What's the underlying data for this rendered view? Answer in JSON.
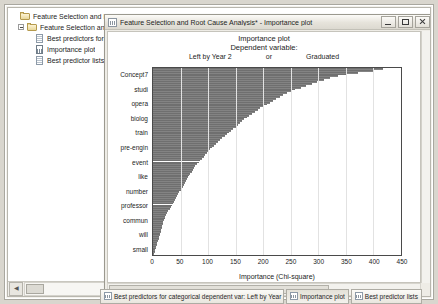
{
  "window": {
    "title": "Feature Selection and Root Cause Analysis* - Importance plot",
    "icon": "chart-document-icon",
    "buttons": {
      "minimize": "Minimize",
      "maximize": "Maximize",
      "close": "Close"
    }
  },
  "tree": {
    "nodes": [
      {
        "label": "Feature Selection and Root",
        "icon": "folder-icon",
        "depth": 0,
        "expander": false
      },
      {
        "label": "Feature Selection and R",
        "icon": "folder-icon",
        "depth": 1,
        "expander": true
      },
      {
        "label": "Best predictors for c",
        "icon": "spreadsheet-icon",
        "depth": 2,
        "expander": false
      },
      {
        "label": "Importance plot",
        "icon": "chart-icon",
        "depth": 2,
        "expander": false
      },
      {
        "label": "Best predictor lists",
        "icon": "spreadsheet-icon",
        "depth": 2,
        "expander": false
      }
    ]
  },
  "taskbar": {
    "items": [
      {
        "label": "Best predictors for categorical dependent var: Left by Year 2..",
        "icon": "spreadsheet-icon"
      },
      {
        "label": "Importance plot",
        "icon": "chart-icon"
      },
      {
        "label": "Best predictor lists",
        "icon": "spreadsheet-icon"
      }
    ]
  },
  "chart_data": {
    "type": "bar",
    "orientation": "horizontal",
    "title": "Importance plot",
    "subtitle": "Dependent variable:",
    "subtitle_groups": [
      "Left by Year 2",
      "or",
      "Graduated"
    ],
    "xlabel": "Importance (Chi-square)",
    "ylabel": "",
    "xlim": [
      0,
      450
    ],
    "xticks": [
      0,
      50,
      100,
      150,
      200,
      250,
      300,
      350,
      400,
      450
    ],
    "grid": true,
    "legend": "none",
    "bar_color": "#838383",
    "categories": [
      "Concept7",
      "studi",
      "opera",
      "biolog",
      "train",
      "pre-engin",
      "event",
      "like",
      "number",
      "professor",
      "commun",
      "will",
      "small"
    ],
    "values": [
      420,
      300,
      230,
      170,
      125,
      96,
      74,
      58,
      44,
      32,
      22,
      13,
      5
    ],
    "detail_values": [
      418,
      400,
      372,
      352,
      336,
      322,
      310,
      298,
      288,
      278,
      268,
      258,
      250,
      243,
      236,
      230,
      224,
      218,
      212,
      206,
      200,
      195,
      190,
      185,
      180,
      175,
      170,
      166,
      162,
      158,
      154,
      150,
      146,
      142,
      138,
      134,
      130,
      126,
      122,
      118,
      114,
      110,
      107,
      104,
      101,
      98,
      95,
      92,
      89,
      86,
      83,
      80,
      77,
      74,
      72,
      70,
      68,
      66,
      64,
      62,
      60,
      58,
      56,
      54,
      52,
      50,
      48,
      46,
      44,
      42,
      40,
      38,
      36,
      34,
      32,
      30,
      28,
      26,
      24,
      22,
      21,
      20,
      19,
      18,
      17,
      16,
      15,
      14,
      13,
      12,
      11,
      10,
      9,
      8,
      7,
      6,
      5,
      4,
      3,
      2
    ]
  }
}
